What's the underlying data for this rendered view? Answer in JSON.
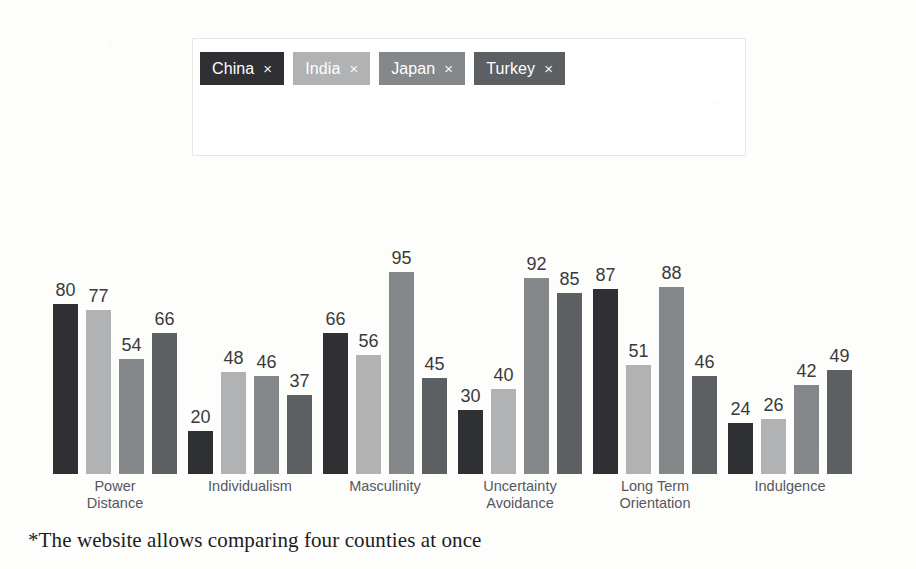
{
  "selector": {
    "name": "country-selector",
    "tags": [
      {
        "label": "China",
        "remove": "×",
        "color": "#2f3033"
      },
      {
        "label": "India",
        "remove": "×",
        "color": "#b0b2b4"
      },
      {
        "label": "Japan",
        "remove": "×",
        "color": "#85888b"
      },
      {
        "label": "Turkey",
        "remove": "×",
        "color": "#5d6063"
      }
    ]
  },
  "caption": {
    "text": "*The website allows comparing four counties at once"
  },
  "chart_data": {
    "type": "bar",
    "title": "",
    "xlabel": "",
    "ylabel": "",
    "ylim": [
      0,
      100
    ],
    "grid": false,
    "legend_position": "top",
    "value_labels": true,
    "categories": [
      "Power\nDistance",
      "Individualism",
      "Masculinity",
      "Uncertainty\nAvoidance",
      "Long Term\nOrientation",
      "Indulgence"
    ],
    "series": [
      {
        "name": "China",
        "color": "#2f3033",
        "values": [
          80,
          20,
          66,
          30,
          87,
          24
        ]
      },
      {
        "name": "India",
        "color": "#b0b2b4",
        "values": [
          77,
          48,
          56,
          40,
          51,
          26
        ]
      },
      {
        "name": "Japan",
        "color": "#85888b",
        "values": [
          54,
          46,
          95,
          92,
          88,
          42
        ]
      },
      {
        "name": "Turkey",
        "color": "#5d6063",
        "values": [
          66,
          37,
          45,
          85,
          46,
          49
        ]
      }
    ]
  }
}
